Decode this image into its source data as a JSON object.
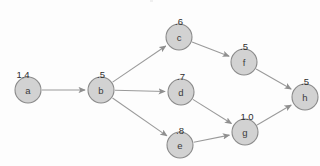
{
  "diagram": {
    "title_text": "",
    "type": "directed-acyclic-graph",
    "background_color": "#fdfdfd",
    "node_fill_color": "#d2d2d2",
    "node_stroke_color": "#8a8a8a",
    "edge_color": "#9a9a9a",
    "label_color": "#2e2e2e",
    "node_radius": 13,
    "nodes": [
      {
        "id": "a",
        "label": "a",
        "value": "1.4",
        "cx": 28,
        "cy": 90,
        "value_x": 20,
        "value_y": 70
      },
      {
        "id": "b",
        "label": "b",
        "value": ".5",
        "cx": 101,
        "cy": 90,
        "value_x": 98,
        "value_y": 70
      },
      {
        "id": "c",
        "label": "c",
        "value": ".6",
        "cx": 179,
        "cy": 37,
        "value_x": 176,
        "value_y": 17
      },
      {
        "id": "d",
        "label": "d",
        "value": ".7",
        "cx": 181,
        "cy": 92,
        "value_x": 178,
        "value_y": 72
      },
      {
        "id": "e",
        "label": "e",
        "value": ".8",
        "cx": 180,
        "cy": 145,
        "value_x": 177,
        "value_y": 126
      },
      {
        "id": "f",
        "label": "f",
        "value": ".5",
        "cx": 244,
        "cy": 62,
        "value_x": 241,
        "value_y": 42
      },
      {
        "id": "g",
        "label": "g",
        "value": "1.0",
        "cx": 245,
        "cy": 132,
        "value_x": 244,
        "value_y": 112
      },
      {
        "id": "h",
        "label": "h",
        "value": ".5",
        "cx": 305,
        "cy": 97,
        "value_x": 302,
        "value_y": 77
      }
    ],
    "edges": [
      {
        "from": "a",
        "to": "b"
      },
      {
        "from": "b",
        "to": "c"
      },
      {
        "from": "b",
        "to": "d"
      },
      {
        "from": "b",
        "to": "e"
      },
      {
        "from": "c",
        "to": "f"
      },
      {
        "from": "d",
        "to": "g"
      },
      {
        "from": "e",
        "to": "g"
      },
      {
        "from": "f",
        "to": "h"
      },
      {
        "from": "g",
        "to": "h"
      }
    ]
  }
}
